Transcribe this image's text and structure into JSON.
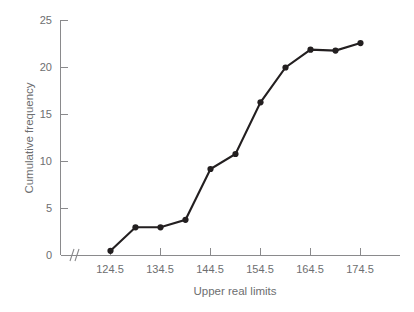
{
  "chart_data": {
    "type": "line",
    "title": "",
    "xlabel": "Upper real limits",
    "ylabel": "Cumulative frequency",
    "x": [
      124.5,
      129.5,
      134.5,
      139.5,
      144.5,
      149.5,
      154.5,
      159.5,
      164.5,
      169.5,
      174.5
    ],
    "values": [
      0.5,
      3,
      3,
      3.8,
      9.2,
      10.8,
      16.3,
      20,
      21.9,
      21.8,
      22.6
    ],
    "series": [
      {
        "name": "Cumulative frequency",
        "values": [
          0.5,
          3,
          3,
          3.8,
          9.2,
          10.8,
          16.3,
          20,
          21.9,
          21.8,
          22.6
        ]
      }
    ],
    "xlim": [
      124.5,
      174.5
    ],
    "ylim": [
      0,
      25
    ],
    "xticks": [
      124.5,
      134.5,
      144.5,
      154.5,
      164.5,
      174.5
    ],
    "xtick_labels": [
      "124.5",
      "134.5",
      "144.5",
      "154.5",
      "164.5",
      "174.5"
    ],
    "yticks": [
      0,
      5,
      10,
      15,
      20,
      25
    ],
    "ytick_labels": [
      "0",
      "5",
      "10",
      "15",
      "20",
      "25"
    ],
    "grid": false,
    "legend": false,
    "legend_position": "none",
    "axis_break": {
      "axis": "x",
      "symbol": "zigzag",
      "note": "break between origin and first plotted value"
    },
    "marker": "filled-circle",
    "colors": {
      "line": "#231f20",
      "marker": "#231f20",
      "axis": "#8a8a8c",
      "text": "#6d6e70",
      "background": "#ffffff"
    }
  }
}
